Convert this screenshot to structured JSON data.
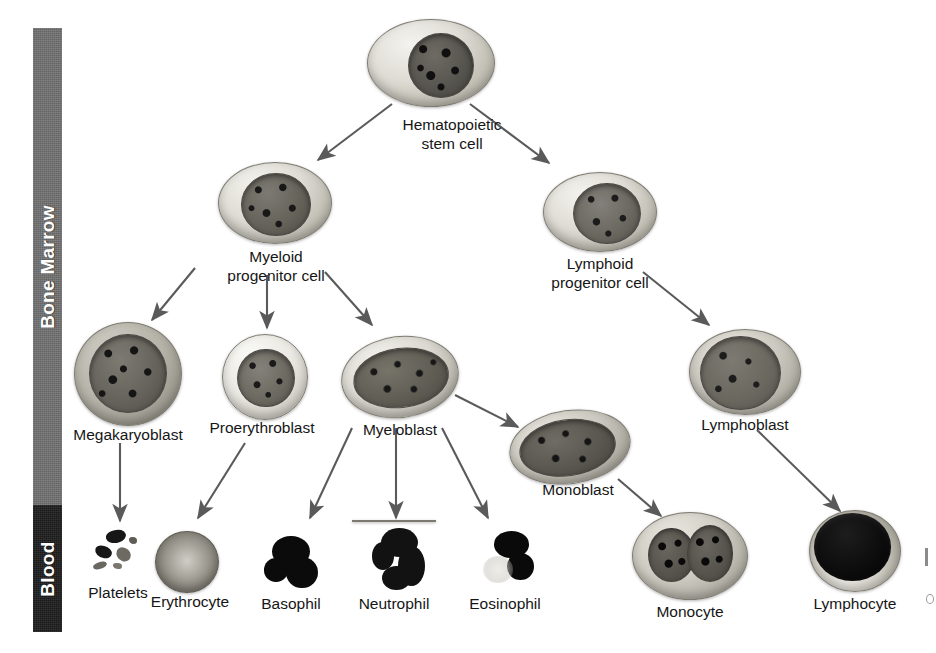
{
  "figure": {
    "background_color": "#ffffff",
    "line_color": "#5a5a5a"
  },
  "compartments": [
    {
      "id": "bone-marrow",
      "label": "Bone Marrow",
      "color": "#6e6e6e",
      "text_color": "#ffffff"
    },
    {
      "id": "blood",
      "label": "Blood",
      "color": "#1d1d1d",
      "text_color": "#ffffff"
    }
  ],
  "cells": [
    {
      "id": "hematopoietic-stem-cell",
      "label": "Hematopoietic\nstem cell",
      "tier": 1,
      "compartment": "bone-marrow"
    },
    {
      "id": "myeloid-progenitor-cell",
      "label": "Myeloid\nprogenitor cell",
      "tier": 2,
      "compartment": "bone-marrow"
    },
    {
      "id": "lymphoid-progenitor-cell",
      "label": "Lymphoid\nprogenitor cell",
      "tier": 2,
      "compartment": "bone-marrow"
    },
    {
      "id": "megakaryoblast",
      "label": "Megakaryoblast",
      "tier": 3,
      "compartment": "bone-marrow"
    },
    {
      "id": "proerythroblast",
      "label": "Proerythroblast",
      "tier": 3,
      "compartment": "bone-marrow"
    },
    {
      "id": "myeloblast",
      "label": "Myeloblast",
      "tier": 3,
      "compartment": "bone-marrow"
    },
    {
      "id": "monoblast",
      "label": "Monoblast",
      "tier": 3,
      "compartment": "bone-marrow"
    },
    {
      "id": "lymphoblast",
      "label": "Lymphoblast",
      "tier": 3,
      "compartment": "bone-marrow"
    },
    {
      "id": "platelets",
      "label": "Platelets",
      "tier": 4,
      "compartment": "blood"
    },
    {
      "id": "erythrocyte",
      "label": "Erythrocyte",
      "tier": 4,
      "compartment": "blood"
    },
    {
      "id": "basophil",
      "label": "Basophil",
      "tier": 4,
      "compartment": "blood"
    },
    {
      "id": "neutrophil",
      "label": "Neutrophil",
      "tier": 4,
      "compartment": "blood"
    },
    {
      "id": "eosinophil",
      "label": "Eosinophil",
      "tier": 4,
      "compartment": "blood"
    },
    {
      "id": "monocyte",
      "label": "Monocyte",
      "tier": 4,
      "compartment": "blood"
    },
    {
      "id": "lymphocyte",
      "label": "Lymphocyte",
      "tier": 4,
      "compartment": "blood"
    }
  ],
  "arrows": [
    {
      "from": "hematopoietic-stem-cell",
      "to": "myeloid-progenitor-cell"
    },
    {
      "from": "hematopoietic-stem-cell",
      "to": "lymphoid-progenitor-cell"
    },
    {
      "from": "myeloid-progenitor-cell",
      "to": "megakaryoblast"
    },
    {
      "from": "myeloid-progenitor-cell",
      "to": "proerythroblast"
    },
    {
      "from": "myeloid-progenitor-cell",
      "to": "myeloblast"
    },
    {
      "from": "myeloblast",
      "to": "monoblast"
    },
    {
      "from": "lymphoid-progenitor-cell",
      "to": "lymphoblast"
    },
    {
      "from": "megakaryoblast",
      "to": "platelets"
    },
    {
      "from": "proerythroblast",
      "to": "erythrocyte"
    },
    {
      "from": "myeloblast",
      "to": "basophil"
    },
    {
      "from": "myeloblast",
      "to": "neutrophil"
    },
    {
      "from": "myeloblast",
      "to": "eosinophil"
    },
    {
      "from": "monoblast",
      "to": "monocyte"
    },
    {
      "from": "lymphoblast",
      "to": "lymphocyte"
    }
  ]
}
